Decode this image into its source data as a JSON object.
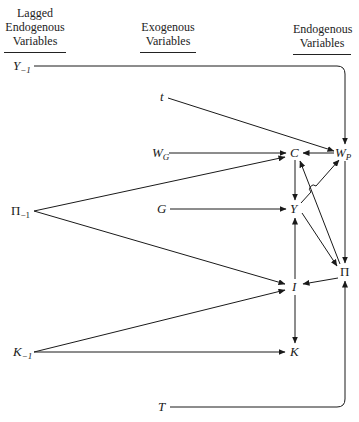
{
  "headers": {
    "lagged": [
      "Lagged",
      "Endogenous",
      "Variables"
    ],
    "exogenous": [
      "Exogenous",
      "Variables"
    ],
    "endogenous": [
      "Endogenous",
      "Variables"
    ]
  },
  "nodes": {
    "Y_lag": {
      "base": "Y",
      "sub": "−1"
    },
    "Pi_lag": {
      "base": "Π",
      "sub": "−1"
    },
    "K_lag": {
      "base": "K",
      "sub": "−1"
    },
    "t": {
      "base": "t"
    },
    "W_G": {
      "base": "W",
      "sub": "G"
    },
    "G": {
      "base": "G"
    },
    "T": {
      "base": "T"
    },
    "C": {
      "base": "C"
    },
    "W_P": {
      "base": "W",
      "sub": "P"
    },
    "Y": {
      "base": "Y"
    },
    "Pi": {
      "base": "Π"
    },
    "I": {
      "base": "I"
    },
    "K": {
      "base": "K"
    }
  },
  "edges": [
    [
      "Y_-1",
      "W_P"
    ],
    [
      "t",
      "W_P"
    ],
    [
      "W_G",
      "C"
    ],
    [
      "W_P",
      "C"
    ],
    [
      "Π_-1",
      "C"
    ],
    [
      "Π_-1",
      "I"
    ],
    [
      "G",
      "Y"
    ],
    [
      "C",
      "Y"
    ],
    [
      "Y",
      "W_P"
    ],
    [
      "Y",
      "Π"
    ],
    [
      "Π",
      "C"
    ],
    [
      "W_P",
      "Π"
    ],
    [
      "Π",
      "I"
    ],
    [
      "I",
      "Y"
    ],
    [
      "I",
      "K"
    ],
    [
      "K_-1",
      "I"
    ],
    [
      "K_-1",
      "K"
    ],
    [
      "T",
      "Π"
    ]
  ]
}
